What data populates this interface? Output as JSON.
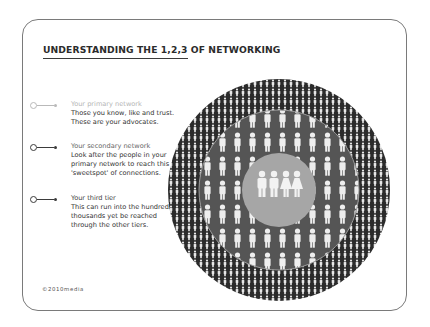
{
  "title": "UNDERSTANDING THE 1,2,3 OF NETWORKING",
  "legend": [
    {
      "heading": "Your primary network",
      "body": "Those you know, like and trust. These are your advocates.",
      "color": "#b9b9b9"
    },
    {
      "heading": "Your secondary network",
      "body": "Look after the people in your primary network to reach this 'sweetspot' of connections.",
      "color": "#3b3b3b"
    },
    {
      "heading": "Your third tier",
      "body": "This can run into the hundreds of thousands yet be reached through the other tiers.",
      "color": "#3b3b3b"
    }
  ],
  "footer": "©2010media",
  "diagram": {
    "outer_ring": {
      "label": "third tier",
      "fill": "#2b2b2b",
      "figure_color": "#e8e8e8"
    },
    "middle_ring": {
      "label": "secondary network",
      "fill": "#555555",
      "figure_color": "#eeeeee"
    },
    "inner_circle": {
      "label": "primary network",
      "fill": "#a6a6a6",
      "figure_color": "#f2f2f2",
      "figures": [
        "man",
        "man",
        "woman",
        "woman"
      ]
    }
  }
}
